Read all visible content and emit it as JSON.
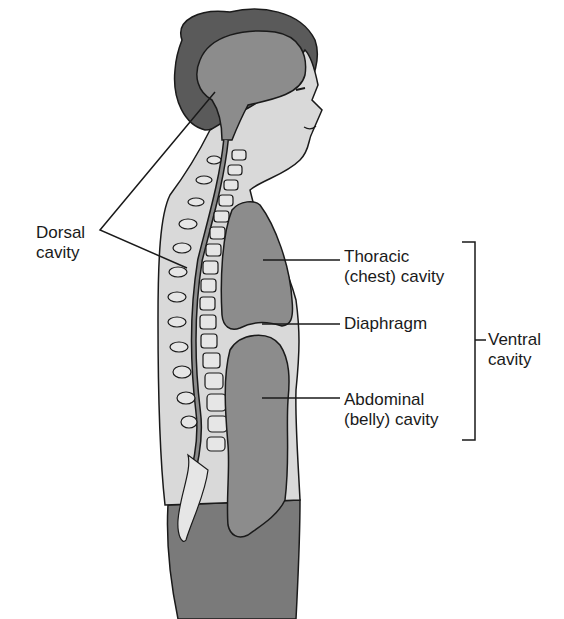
{
  "figure": {
    "type": "anatomical-diagram"
  },
  "labels": {
    "dorsal": {
      "line1": "Dorsal",
      "line2": "cavity"
    },
    "thoracic": {
      "line1": "Thoracic",
      "line2": "(chest) cavity"
    },
    "diaphragm": {
      "line1": "Diaphragm"
    },
    "abdominal": {
      "line1": "Abdominal",
      "line2": "(belly) cavity"
    },
    "ventral": {
      "line1": "Ventral",
      "line2": "cavity"
    }
  },
  "colors": {
    "hair": "#5a5a5a",
    "skin_light": "#d9d9d9",
    "cavity_dark": "#8c8c8c",
    "legs": "#7a7a7a",
    "outline": "#1a1a1a",
    "vertebra": "#e6e6e6"
  }
}
